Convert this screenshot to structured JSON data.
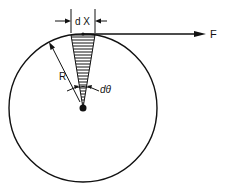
{
  "diagram": {
    "labels": {
      "dx": "d X",
      "force": "F",
      "radius": "R",
      "dtheta": "dθ"
    },
    "colors": {
      "stroke": "#111111",
      "background": "#ffffff"
    },
    "geometry": {
      "circle_center": [
        83,
        108
      ],
      "circle_radius": 74,
      "wedge_top_left": [
        71,
        34
      ],
      "wedge_top_right": [
        95,
        34
      ],
      "force_arrow_end": [
        206,
        34
      ]
    }
  }
}
